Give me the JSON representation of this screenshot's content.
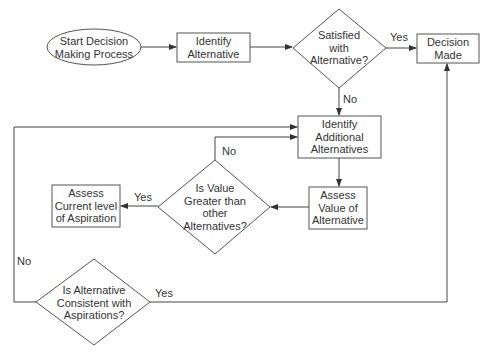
{
  "diagram": {
    "type": "flowchart",
    "nodes": {
      "start": {
        "line1": "Start Decision",
        "line2": "Making Process",
        "shape": "ellipse"
      },
      "identify": {
        "line1": "Identify",
        "line2": "Alternative",
        "shape": "rect"
      },
      "satisfied": {
        "line1": "Satisfied",
        "line2": "with",
        "line3": "Alternative?",
        "shape": "diamond"
      },
      "decision_made": {
        "line1": "Decision",
        "line2": "Made",
        "shape": "rect"
      },
      "identify_additional": {
        "line1": "Identify",
        "line2": "Additional",
        "line3": "Alternatives",
        "shape": "rect"
      },
      "assess_value": {
        "line1": "Assess",
        "line2": "Value of",
        "line3": "Alternative",
        "shape": "rect"
      },
      "is_value_greater": {
        "line1": "Is Value",
        "line2": "Greater than",
        "line3": "other",
        "line4": "Alternatives?",
        "shape": "diamond"
      },
      "assess_aspiration": {
        "line1": "Assess",
        "line2": "Current level",
        "line3": "of Aspiration",
        "shape": "rect"
      },
      "is_consistent": {
        "line1": "Is Alternative",
        "line2": "Consistent with",
        "line3": "Aspirations?",
        "shape": "diamond"
      }
    },
    "edges": {
      "satisfied_yes": "Yes",
      "satisfied_no": "No",
      "greater_yes": "Yes",
      "greater_no": "No",
      "consistent_yes": "Yes",
      "consistent_no": "No"
    }
  }
}
